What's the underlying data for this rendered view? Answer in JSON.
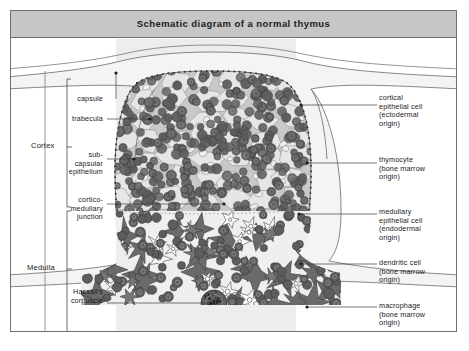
{
  "header": {
    "title": "Schematic diagram of a normal thymus"
  },
  "regions": {
    "cortex": "Cortex",
    "medulla": "Medulla"
  },
  "left_labels": [
    {
      "id": "capsule",
      "text": "capsule"
    },
    {
      "id": "trabecula",
      "text": "trabecula"
    },
    {
      "id": "subcapsular-epithelium",
      "text": "sub-\ncapsular\nepithelium"
    },
    {
      "id": "cortico-medullary-junction",
      "text": "cortico-\nmedullary\njunction"
    },
    {
      "id": "hassalls-corpuscle",
      "text": "Hassall's\ncorpuscle"
    }
  ],
  "right_labels": [
    {
      "id": "cortical-epithelial-cell",
      "text": "cortical\nepithelial cell\n(ectodermal\norigin)"
    },
    {
      "id": "thymocyte",
      "text": "thymocyte\n(bone marrow\norigin)"
    },
    {
      "id": "medullary-epithelial-cell",
      "text": "medullary\nepithelial cell\n(endodermal\norigin)"
    },
    {
      "id": "dendritic-cell",
      "text": "dendritic cell\n(bone marrow\norigin)"
    },
    {
      "id": "macrophage",
      "text": "macrophage\n(bone marrow\norigin)"
    }
  ],
  "colors": {
    "frame_border": "#6f6f6f",
    "title_bg": "#c6c6c6",
    "page_bg": "#ffffff",
    "tissue_band": "#ededed",
    "capsule_fill": "#f4f4f4",
    "cortex_stroma": "#b9b9b9",
    "medulla_stroma": "#6a6a6a",
    "thymocyte": "#5d5d5d",
    "epithelial_light": "#eaeaea",
    "hassall": "#5a5a5a",
    "leader": "#3c3c3c"
  }
}
